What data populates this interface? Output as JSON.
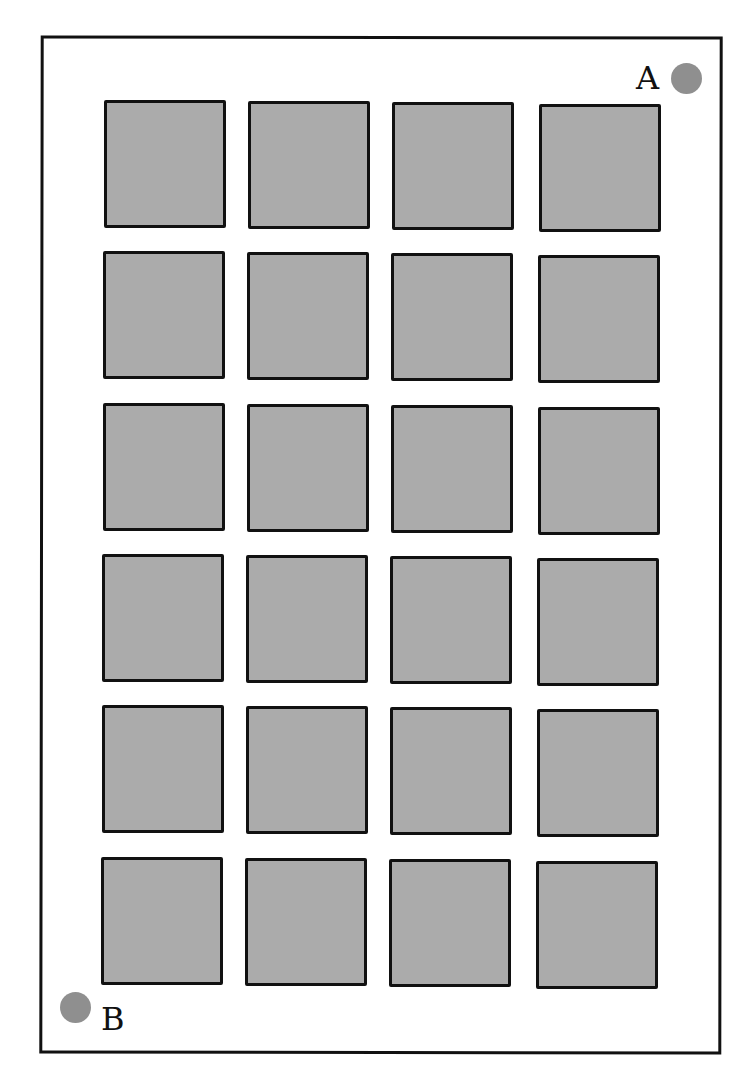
{
  "figure": {
    "rows": 6,
    "columns": 4,
    "cell_fill": "#ababab",
    "border_color": "#111111",
    "marker_color": "#8f8f8f"
  },
  "markers": [
    {
      "label": "A",
      "position": "top-right"
    },
    {
      "label": "B",
      "position": "bottom-left"
    }
  ]
}
